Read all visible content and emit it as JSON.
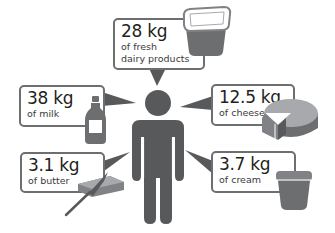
{
  "colors": {
    "figure": "#58595b",
    "border": "#6d6e70",
    "text": "#231f20",
    "light": "#a7a9ac"
  },
  "figure": {
    "icon": "person-icon"
  },
  "items": [
    {
      "id": "dairy",
      "amount": "28 kg",
      "desc_lines": [
        "of fresh",
        "dairy products"
      ],
      "icon": "yogurt-cup-icon"
    },
    {
      "id": "milk",
      "amount": "38 kg",
      "desc_lines": [
        "of milk"
      ],
      "icon": "milk-bottle-icon"
    },
    {
      "id": "cheese",
      "amount": "12.5 kg",
      "desc_lines": [
        "of cheese"
      ],
      "icon": "cheese-wheel-icon"
    },
    {
      "id": "butter",
      "amount": "3.1 kg",
      "desc_lines": [
        "of butter"
      ],
      "icon": "butter-knife-icon"
    },
    {
      "id": "cream",
      "amount": "3.7 kg",
      "desc_lines": [
        "of cream"
      ],
      "icon": "cream-tub-icon"
    }
  ]
}
